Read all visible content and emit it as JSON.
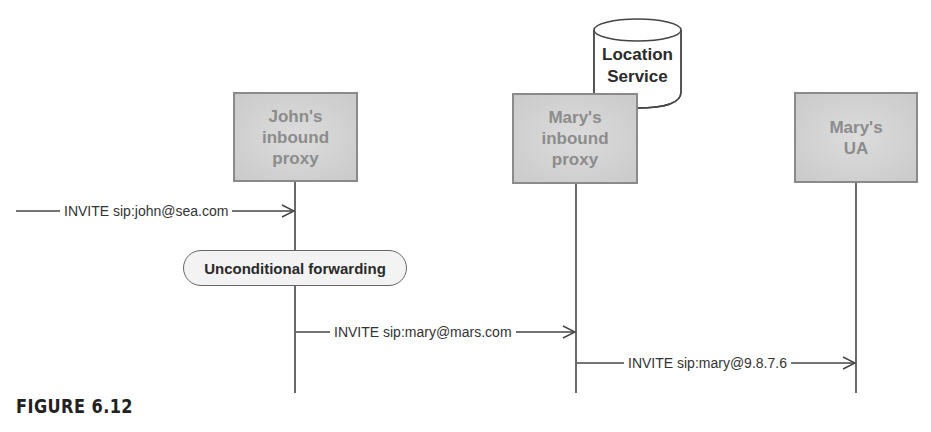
{
  "participants": [
    {
      "id": "johns-proxy",
      "label": "John's\ninbound\nproxy"
    },
    {
      "id": "marys-proxy",
      "label": "Mary's\ninbound\nproxy"
    },
    {
      "id": "marys-ua",
      "label": "Mary's\nUA"
    }
  ],
  "location_service": {
    "label": "Location\nService"
  },
  "messages": [
    {
      "label": "INVITE sip:john@sea.com",
      "from": "external",
      "to": "johns-proxy"
    },
    {
      "label": "INVITE sip:mary@mars.com",
      "from": "johns-proxy",
      "to": "marys-proxy"
    },
    {
      "label": "INVITE sip:mary@9.8.7.6",
      "from": "marys-proxy",
      "to": "marys-ua"
    }
  ],
  "annotation": {
    "label": "Unconditional forwarding"
  },
  "caption": "FIGURE 6.12",
  "colors": {
    "box_fill": "#cfcfcf",
    "box_border": "#8a8a8a",
    "box_text": "#8c8c8c",
    "line": "#444444"
  }
}
